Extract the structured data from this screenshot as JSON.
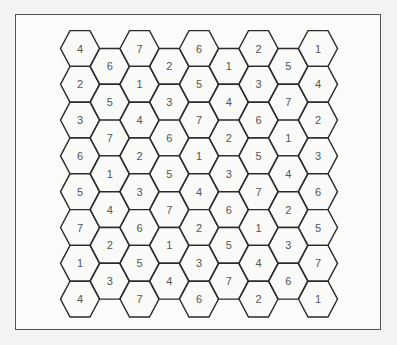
{
  "puzzle": {
    "columns": [
      {
        "offset": false,
        "values": [
          "4",
          "2",
          "3",
          "6",
          "5",
          "7",
          "1",
          "4"
        ]
      },
      {
        "offset": true,
        "values": [
          "6",
          "5",
          "7",
          "1",
          "4",
          "2",
          "3"
        ]
      },
      {
        "offset": false,
        "values": [
          "7",
          "1",
          "4",
          "2",
          "3",
          "6",
          "5",
          "7"
        ]
      },
      {
        "offset": true,
        "values": [
          "2",
          "3",
          "6",
          "5",
          "7",
          "1",
          "4"
        ]
      },
      {
        "offset": false,
        "values": [
          "6",
          "5",
          "7",
          "1",
          "4",
          "2",
          "3",
          "6"
        ]
      },
      {
        "offset": true,
        "values": [
          "1",
          "4",
          "2",
          "3",
          "6",
          "5",
          "7"
        ]
      },
      {
        "offset": false,
        "values": [
          "2",
          "3",
          "6",
          "5",
          "7",
          "1",
          "4",
          "2"
        ]
      },
      {
        "offset": true,
        "values": [
          "5",
          "7",
          "1",
          "4",
          "2",
          "3",
          "6"
        ]
      },
      {
        "offset": false,
        "values": [
          "1",
          "4",
          "2",
          "3",
          "6",
          "5",
          "7",
          "1"
        ]
      }
    ]
  },
  "colors": {
    "hex_stroke": "#2a2a2a",
    "hex_fill": "#fafaf8",
    "label": "#555555",
    "frame": "#555555"
  }
}
